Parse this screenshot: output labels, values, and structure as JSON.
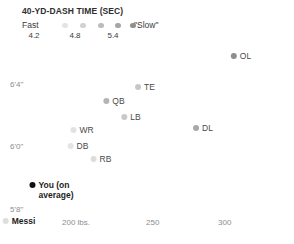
{
  "legend": {
    "title": "40-YD-DASH TIME (SEC)",
    "fast_label": "Fast",
    "slow_label": "\"Slow\"",
    "swatches": [
      {
        "color": "#e4e4e4",
        "x": 40
      },
      {
        "color": "#d2d2d2",
        "x": 58
      },
      {
        "color": "#bcbcbc",
        "x": 76
      },
      {
        "color": "#a6a6a6",
        "x": 93
      },
      {
        "color": "#8f8f8f",
        "x": 108
      }
    ],
    "ticks": [
      {
        "label": "4.2",
        "x": 12
      },
      {
        "label": "4.8",
        "x": 53
      },
      {
        "label": "5.4",
        "x": 91
      }
    ]
  },
  "axes": {
    "y_ticks": [
      {
        "label": "6'4\"",
        "x": 10,
        "y": 84
      },
      {
        "label": "6'0\"",
        "x": 10,
        "y": 146
      },
      {
        "label": "5'8\"",
        "x": 10,
        "y": 209
      }
    ],
    "x_ticks": [
      {
        "label": "200 lbs.",
        "x": 62
      },
      {
        "label": "250",
        "x": 146
      },
      {
        "label": "300",
        "x": 218
      }
    ]
  },
  "chart_data": {
    "type": "scatter",
    "title": "40-YD-DASH TIME (SEC)",
    "xlabel": "Weight (lbs.)",
    "ylabel": "Height",
    "xlim": [
      185,
      320
    ],
    "ylim": [
      66,
      78
    ],
    "grid": false,
    "legend_position": "top-left",
    "color_scale": {
      "variable": "40-yd-dash time (sec)",
      "min_label": "Fast",
      "max_label": "\"Slow\"",
      "ticks": [
        4.2,
        4.8,
        5.4
      ]
    },
    "points": [
      {
        "name": "OL",
        "label": "OL",
        "weight": 312,
        "height_in": 77.0,
        "dash_sec": 5.4,
        "color": "#8f8f8f",
        "px": 241,
        "py": 56
      },
      {
        "name": "TE",
        "label": "TE",
        "weight": 254,
        "height_in": 76.0,
        "dash_sec": 4.8,
        "color": "#c7c7c7",
        "px": 145,
        "py": 87
      },
      {
        "name": "QB",
        "label": "QB",
        "weight": 225,
        "height_in": 75.3,
        "dash_sec": 4.9,
        "color": "#b4b4b4",
        "px": 114,
        "py": 101
      },
      {
        "name": "LB",
        "label": "LB",
        "weight": 240,
        "height_in": 74.6,
        "dash_sec": 4.7,
        "color": "#c9c9c9",
        "px": 131,
        "py": 117
      },
      {
        "name": "WR",
        "label": "WR",
        "weight": 202,
        "height_in": 72.6,
        "dash_sec": 4.5,
        "color": "#e2e2e2",
        "px": 82,
        "py": 130
      },
      {
        "name": "DL",
        "label": "DL",
        "weight": 288,
        "height_in": 74.8,
        "dash_sec": 5.1,
        "color": "#a8a8a8",
        "px": 203,
        "py": 128
      },
      {
        "name": "DB",
        "label": "DB",
        "weight": 197,
        "height_in": 71.7,
        "dash_sec": 4.5,
        "color": "#e4e4e4",
        "px": 78,
        "py": 146
      },
      {
        "name": "RB",
        "label": "RB",
        "weight": 214,
        "height_in": 70.9,
        "dash_sec": 4.5,
        "color": "#dcdcdc",
        "px": 101,
        "py": 159
      },
      {
        "name": "You (on average)",
        "label": "You (on average)",
        "weight": 196,
        "height_in": 69.2,
        "dash_sec": null,
        "color": "#111111",
        "px": 56,
        "py": 190,
        "two_line": true
      },
      {
        "name": "Messi",
        "label": "Messi",
        "weight": 159,
        "height_in": 67.7,
        "dash_sec": 4.2,
        "color": "#dedede",
        "px": 19,
        "py": 221,
        "bold": true
      }
    ]
  }
}
